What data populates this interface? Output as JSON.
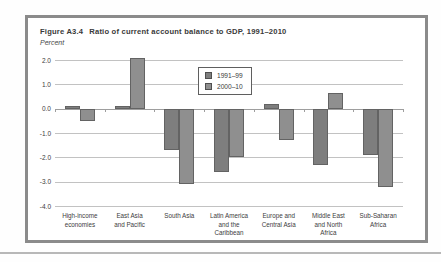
{
  "figure": {
    "label": "Figure A3.4",
    "title": "Ratio of current account balance to GDP, 1991–2010",
    "units_label": "Percent"
  },
  "chart_data": {
    "type": "bar",
    "ylabel": "Percent",
    "xlabel": "",
    "categories": [
      "High-income\neconomies",
      "East Asia\nand Pacific",
      "South Asia",
      "Latin America\nand the\nCaribbean",
      "Europe and\nCentral Asia",
      "Middle East\nand North\nAfrica",
      "Sub-Saharan\nAfrica"
    ],
    "series": [
      {
        "name": "1991–99",
        "color": "#7e7e7e",
        "values": [
          0.1,
          0.1,
          -1.7,
          -2.6,
          0.2,
          -2.3,
          -1.9
        ]
      },
      {
        "name": "2000–10",
        "color": "#8f8f8f",
        "values": [
          -0.5,
          2.1,
          -3.1,
          -2.0,
          -1.3,
          0.65,
          -3.2
        ]
      }
    ],
    "ylim": [
      -4,
      2
    ],
    "yticks": [
      2.0,
      1.0,
      0.0,
      -1.0,
      -2.0,
      -3.0,
      -4.0
    ],
    "ytick_labels": [
      "2.0",
      "1.0",
      "0.0",
      "-1.0",
      "-2.0",
      "-3.0",
      "-4.0"
    ],
    "grid": true,
    "legend_position": "upper center"
  },
  "colors": {
    "frame_border": "#8b8b8b",
    "gridline": "#c2c2c2",
    "zero_line": "#9e9e9e",
    "bar_border": "#636363",
    "separator": "#b8b8b8"
  }
}
